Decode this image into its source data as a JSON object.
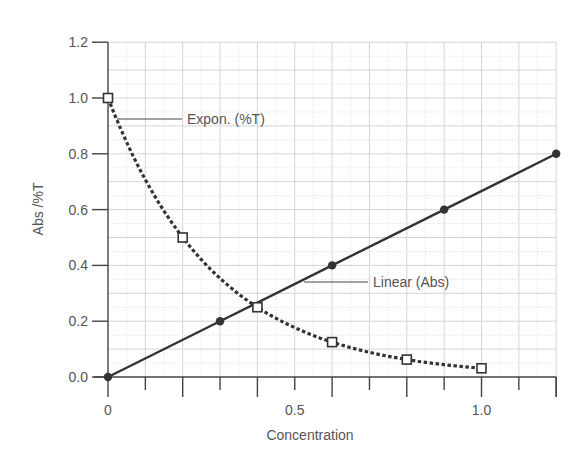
{
  "chart_data": {
    "type": "line",
    "title": "",
    "xlabel": "Concentration",
    "ylabel": "Abs /%T",
    "xlim": [
      0,
      1.2
    ],
    "ylim": [
      0,
      1.2
    ],
    "grid": true,
    "legend": "none (inline annotations)",
    "x_ticks": [
      {
        "value": 0,
        "label": "0"
      },
      {
        "value": 0.5,
        "label": "0.5"
      },
      {
        "value": 1.0,
        "label": "1.0"
      }
    ],
    "y_ticks": [
      {
        "value": 0.0,
        "label": "0.0"
      },
      {
        "value": 0.2,
        "label": "0.2"
      },
      {
        "value": 0.4,
        "label": "0.4"
      },
      {
        "value": 0.6,
        "label": "0.6"
      },
      {
        "value": 0.8,
        "label": "0.8"
      },
      {
        "value": 1.0,
        "label": "1.0"
      },
      {
        "value": 1.2,
        "label": "1.2"
      }
    ],
    "series": [
      {
        "name": "Linear (Abs)",
        "style": "solid",
        "marker": "filled-circle",
        "color": "#333333",
        "x": [
          0,
          0.3,
          0.6,
          0.9,
          1.2
        ],
        "y": [
          0.0,
          0.2,
          0.4,
          0.6,
          0.8
        ]
      },
      {
        "name": "Expon. (%T)",
        "style": "dotted",
        "marker": "open-square",
        "color": "#333333",
        "x": [
          0,
          0.2,
          0.4,
          0.6,
          0.8,
          1.0
        ],
        "y": [
          1.0,
          0.5,
          0.25,
          0.125,
          0.0625,
          0.03125
        ]
      }
    ],
    "annotations": [
      {
        "text": "Expon. (%T)",
        "series": "Expon. (%T)"
      },
      {
        "text": "Linear (Abs)",
        "series": "Linear (Abs)"
      }
    ]
  }
}
